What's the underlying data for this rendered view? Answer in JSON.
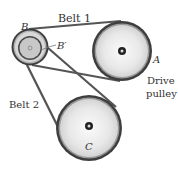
{
  "diagram": {
    "labels": {
      "belt1": "Belt 1",
      "belt2": "Belt 2",
      "pulley_b": "B",
      "pulley_b_prime": "B′",
      "pulley_a": "A",
      "drive_line1": "Drive",
      "drive_line2": "pulley",
      "pulley_c": "C"
    },
    "colors": {
      "belt": "#555555",
      "rim": "#4a4a4a",
      "face": "#e4e4e4",
      "face_light": "#f4f4f4",
      "hub": "#222222"
    }
  }
}
